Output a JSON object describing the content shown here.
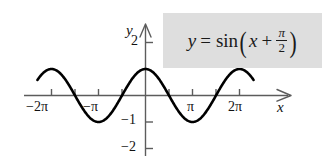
{
  "figure": {
    "equation_box": {
      "lhs": "y",
      "equals": "=",
      "function": "sin",
      "paren_open": "(",
      "arg_var": "x",
      "plus": "+",
      "frac_num": "π",
      "frac_den": "2",
      "paren_close": ")",
      "background_color": "#dedede",
      "plain_text": "y = sin(x + π/2)"
    },
    "axes": {
      "x_axis_label": "x",
      "y_axis_label": "y",
      "x_ticks": [
        {
          "label": "−2π",
          "value": -6.283185
        },
        {
          "label": "",
          "value": -4.712389
        },
        {
          "label": "−π",
          "value": -3.141593
        },
        {
          "label": "",
          "value": -1.570796
        },
        {
          "label": "",
          "value": 1.570796
        },
        {
          "label": "π",
          "value": 3.141593
        },
        {
          "label": "",
          "value": 4.712389
        },
        {
          "label": "2π",
          "value": 6.283185
        }
      ],
      "y_ticks": [
        {
          "label": "2",
          "value": 2
        },
        {
          "label": "−1",
          "value": -1
        },
        {
          "label": "−2",
          "value": -2
        }
      ],
      "x_range": [
        -7.6,
        7.6
      ],
      "y_range": [
        -2.6,
        2.7
      ],
      "curve_color": "#000000",
      "axis_color": "#5c5c5c"
    }
  },
  "chart_data": {
    "type": "line",
    "title": "",
    "subtitle": "",
    "xlabel": "x",
    "ylabel": "y",
    "annotations": [
      "y = sin(x + π/2)"
    ],
    "legend": [],
    "grid": false,
    "xlim": [
      -7.6,
      7.6
    ],
    "ylim": [
      -2.6,
      2.7
    ],
    "xticks": [
      -6.283185,
      -4.712389,
      -3.141593,
      -1.570796,
      1.570796,
      3.141593,
      4.712389,
      6.283185
    ],
    "xticklabels": [
      "−2π",
      "",
      "−π",
      "",
      "",
      "π",
      "",
      "2π"
    ],
    "yticks": [
      2,
      -1,
      -2
    ],
    "yticklabels": [
      "2",
      "−1",
      "−2"
    ],
    "series": [
      {
        "name": "y = sin(x + π/2)",
        "formula": "y = cos(x)",
        "amplitude": 1,
        "period": 6.283185,
        "phase_shift": 1.570796,
        "x_start": -7.225,
        "x_end": 7.225,
        "x": [
          -7.225,
          -6.911,
          -6.597,
          -6.283,
          -5.969,
          -5.655,
          -5.341,
          -5.027,
          -4.712,
          -4.398,
          -4.084,
          -3.77,
          -3.456,
          -3.142,
          -2.827,
          -2.513,
          -2.199,
          -1.885,
          -1.571,
          -1.257,
          -0.942,
          -0.628,
          -0.314,
          0.0,
          0.314,
          0.628,
          0.942,
          1.257,
          1.571,
          1.885,
          2.199,
          2.513,
          2.827,
          3.142,
          3.456,
          3.77,
          4.084,
          4.398,
          4.712,
          5.027,
          5.341,
          5.655,
          5.969,
          6.283,
          6.597,
          6.911,
          7.225
        ],
        "y": [
          0.556,
          0.86,
          0.988,
          1.0,
          0.951,
          0.809,
          0.588,
          0.309,
          0.0,
          -0.309,
          -0.588,
          -0.809,
          -0.951,
          -1.0,
          -0.951,
          -0.809,
          -0.588,
          -0.309,
          0.0,
          0.309,
          0.588,
          0.809,
          0.951,
          1.0,
          0.951,
          0.809,
          0.588,
          0.309,
          0.0,
          -0.309,
          -0.588,
          -0.809,
          -0.951,
          -1.0,
          -0.951,
          -0.809,
          -0.588,
          -0.309,
          0.0,
          0.309,
          0.588,
          0.809,
          0.951,
          1.0,
          0.988,
          0.86,
          0.556
        ]
      }
    ]
  }
}
